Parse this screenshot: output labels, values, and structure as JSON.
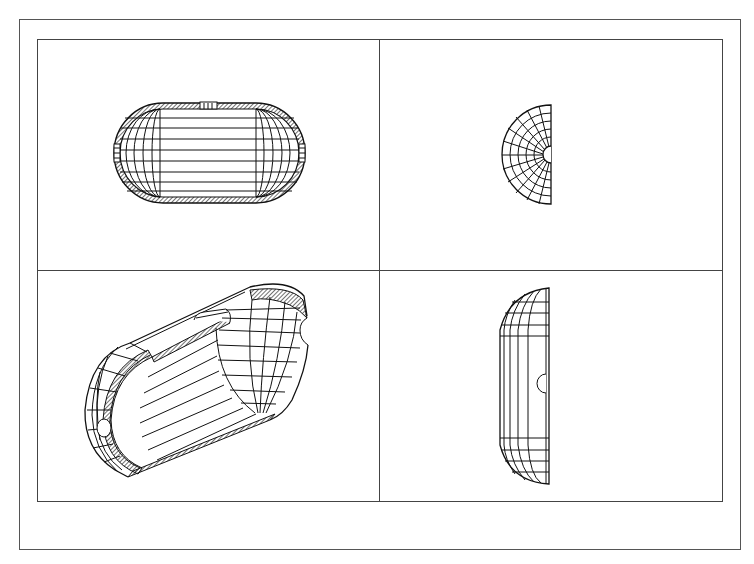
{
  "figure": {
    "views": [
      {
        "id": "top-left",
        "label": "front sectional view",
        "shape": "capsule with hatched shell, top notch, end openings"
      },
      {
        "id": "top-right",
        "label": "end view",
        "shape": "half-disk with radial grid and central notch"
      },
      {
        "id": "bottom-left",
        "label": "isometric cutaway view",
        "shape": "sectioned capsule with notches"
      },
      {
        "id": "bottom-right",
        "label": "side view",
        "shape": "half-capsule profile with semicircular hole"
      }
    ],
    "caption": ""
  },
  "colors": {
    "line": "#111111",
    "frame": "#444444",
    "background": "#ffffff"
  }
}
